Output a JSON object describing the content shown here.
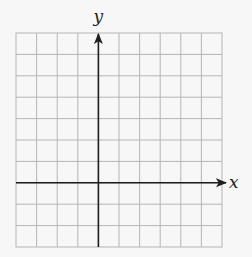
{
  "diagram": {
    "type": "coordinate-grid",
    "grid": {
      "columns": 10,
      "rows": 10,
      "left": 16,
      "top": 33,
      "right": 222,
      "bottom": 247,
      "line_color": "#b5b5b5"
    },
    "axes": {
      "x_label": "x",
      "y_label": "y",
      "origin_col": 4,
      "origin_row": 7,
      "axis_color": "#1e1e1e"
    },
    "background": "#f7f7f7"
  }
}
